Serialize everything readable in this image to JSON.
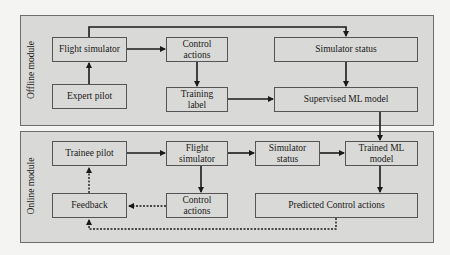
{
  "diagram": {
    "modules": [
      {
        "id": "offline",
        "label": "Offline module"
      },
      {
        "id": "online",
        "label": "Online module"
      }
    ],
    "offline_nodes": {
      "flight_simulator": "Flight simulator",
      "expert_pilot": "Expert pilot",
      "control_actions": "Control actions",
      "training_label": "Training label",
      "simulator_status": "Simulator status",
      "supervised_ml_model": "Supervised ML model"
    },
    "online_nodes": {
      "trainee_pilot": "Trainee pilot",
      "flight_simulator": "Flight simulator",
      "simulator_status": "Simulator status",
      "trained_ml_model": "Trained ML model",
      "feedback": "Feedback",
      "control_actions": "Control actions",
      "predicted_control_actions": "Predicted Control actions"
    },
    "edges": [
      {
        "from": "Expert pilot",
        "to": "Flight simulator (offline)",
        "style": "solid"
      },
      {
        "from": "Flight simulator (offline)",
        "to": "Control actions (offline)",
        "style": "solid"
      },
      {
        "from": "Flight simulator (offline)",
        "to": "Simulator status (offline)",
        "style": "solid"
      },
      {
        "from": "Control actions (offline)",
        "to": "Training label",
        "style": "solid"
      },
      {
        "from": "Simulator status (offline)",
        "to": "Supervised ML model",
        "style": "solid"
      },
      {
        "from": "Training label",
        "to": "Supervised ML model",
        "style": "solid"
      },
      {
        "from": "Supervised ML model",
        "to": "Trained ML model",
        "style": "solid"
      },
      {
        "from": "Trainee pilot",
        "to": "Flight simulator (online)",
        "style": "solid"
      },
      {
        "from": "Flight simulator (online)",
        "to": "Simulator status (online)",
        "style": "solid"
      },
      {
        "from": "Simulator status (online)",
        "to": "Trained ML model",
        "style": "solid"
      },
      {
        "from": "Flight simulator (online)",
        "to": "Control actions (online)",
        "style": "solid"
      },
      {
        "from": "Trained ML model",
        "to": "Predicted Control actions",
        "style": "solid"
      },
      {
        "from": "Control actions (online)",
        "to": "Feedback",
        "style": "dotted"
      },
      {
        "from": "Predicted Control actions",
        "to": "Feedback",
        "style": "dotted"
      },
      {
        "from": "Feedback",
        "to": "Trainee pilot",
        "style": "dotted"
      }
    ],
    "colors": {
      "panel_fill": "#d9d9d7",
      "background": "#f4f4f2",
      "line": "#1a1a1a"
    }
  }
}
